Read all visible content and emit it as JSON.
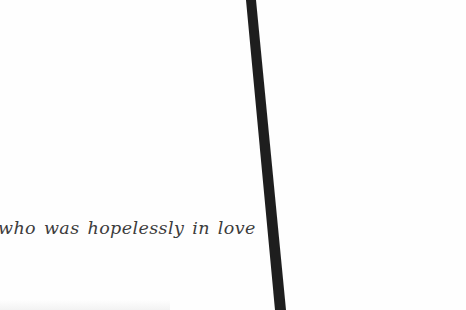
{
  "scene": {
    "background_color": "#ffffff",
    "caption": {
      "text": "who was hopelessly in love",
      "color": "#3c3c3c"
    },
    "diagonal_bar": {
      "color": "#1e1e1e",
      "description": "thick dark diagonal stroke crossing the page from top to bottom"
    }
  }
}
